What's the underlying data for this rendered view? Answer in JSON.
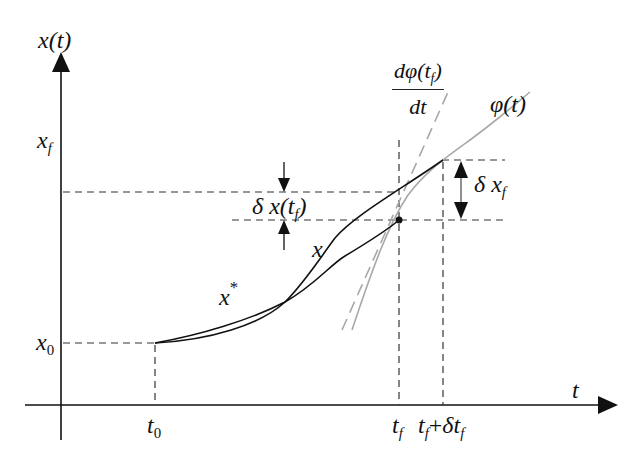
{
  "diagram": {
    "type": "optimal-control-variation-diagram",
    "axes": {
      "y_label": "x(t)",
      "x_label": "t"
    },
    "y_ticks": {
      "x_f": {
        "base": "x",
        "sub": "f"
      },
      "x_0": {
        "base": "x",
        "sub": "0"
      }
    },
    "x_ticks": {
      "t_0": {
        "base": "t",
        "sub": "0"
      },
      "t_f": {
        "base": "t",
        "sub": "f"
      },
      "t_f_plus": {
        "base": "t",
        "sub": "f",
        "op": "+",
        "delta": "δt",
        "delta_sub": "f"
      }
    },
    "curves": {
      "optimal": {
        "base": "x",
        "sup": "*"
      },
      "varied": "x",
      "target": "φ(t)",
      "tangent": {
        "numerator": "dφ(t",
        "numerator_sub": "f",
        "numerator_close": ")",
        "denominator": "dt"
      }
    },
    "annotations": {
      "delta_x_tf": {
        "prefix": "δ x(t",
        "sub": "f",
        "close": ")"
      },
      "delta_x_f": {
        "prefix": "δ x",
        "sub": "f"
      }
    },
    "colors": {
      "ink": "#111111",
      "curve_gray": "#a8a8a8",
      "dash": "#333333"
    }
  }
}
